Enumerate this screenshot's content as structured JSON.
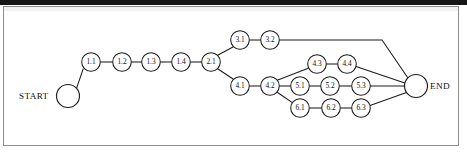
{
  "figure": {
    "kind": "activity-on-node-network-diagram",
    "background_color": "#ffffff",
    "line_color": "#1b1b1b",
    "frame_color": "#8d8d8d",
    "top_band_color": "#151515"
  },
  "terminals": {
    "start": {
      "label": "START",
      "cx": 68,
      "cy": 96,
      "r": 11.5,
      "label_x": 19,
      "label_y": 99
    },
    "end": {
      "label": "END",
      "cx": 416,
      "cy": 86,
      "r": 11.5,
      "label_x": 430,
      "label_y": 89
    }
  },
  "nodes": [
    {
      "id": "1.1",
      "label": "1.1",
      "cx": 91,
      "cy": 62,
      "r": 9.3
    },
    {
      "id": "1.2",
      "label": "1.2",
      "cx": 122,
      "cy": 62,
      "r": 9.3
    },
    {
      "id": "1.3",
      "label": "1.3",
      "cx": 151,
      "cy": 62,
      "r": 9.3
    },
    {
      "id": "1.4",
      "label": "1.4",
      "cx": 181,
      "cy": 62,
      "r": 9.3
    },
    {
      "id": "2.1",
      "label": "2.1",
      "cx": 211,
      "cy": 62,
      "r": 9.3
    },
    {
      "id": "3.1",
      "label": "3.1",
      "cx": 240,
      "cy": 40,
      "r": 9.3
    },
    {
      "id": "3.2",
      "label": "3.2",
      "cx": 270,
      "cy": 40,
      "r": 9.3
    },
    {
      "id": "4.1",
      "label": "4.1",
      "cx": 240,
      "cy": 86,
      "r": 9.3
    },
    {
      "id": "4.2",
      "label": "4.2",
      "cx": 270,
      "cy": 86,
      "r": 9.3
    },
    {
      "id": "4.3",
      "label": "4.3",
      "cx": 317,
      "cy": 64,
      "r": 9.3
    },
    {
      "id": "4.4",
      "label": "4.4",
      "cx": 347,
      "cy": 64,
      "r": 9.3
    },
    {
      "id": "5.1",
      "label": "5.1",
      "cx": 300,
      "cy": 86,
      "r": 9.3
    },
    {
      "id": "5.2",
      "label": "5.2",
      "cx": 330,
      "cy": 86,
      "r": 9.3
    },
    {
      "id": "5.3",
      "label": "5.3",
      "cx": 361,
      "cy": 86,
      "r": 9.3
    },
    {
      "id": "6.1",
      "label": "6.1",
      "cx": 300,
      "cy": 108,
      "r": 9.3
    },
    {
      "id": "6.2",
      "label": "6.2",
      "cx": 331,
      "cy": 108,
      "r": 9.3
    },
    {
      "id": "6.3",
      "label": "6.3",
      "cx": 361,
      "cy": 108,
      "r": 9.3
    }
  ],
  "edges": [
    {
      "from": "START",
      "to": "1.1",
      "points": "76.5,88.4 83.3,68.6"
    },
    {
      "from": "1.1",
      "to": "1.2",
      "points": "100.3,62 112.7,62"
    },
    {
      "from": "1.2",
      "to": "1.3",
      "points": "131.3,62 141.7,62"
    },
    {
      "from": "1.3",
      "to": "1.4",
      "points": "160.3,62 171.7,62"
    },
    {
      "from": "1.4",
      "to": "2.1",
      "points": "190.3,62 201.7,62"
    },
    {
      "from": "2.1",
      "to": "3.1",
      "points": "217.6,55.2 233.4,46.8"
    },
    {
      "from": "2.1",
      "to": "4.1",
      "points": "217.6,68.8 233.4,79.2"
    },
    {
      "from": "3.1",
      "to": "3.2",
      "points": "249.3,40 260.7,40"
    },
    {
      "from": "3.2",
      "to": "END",
      "points": "279.3,40 382,40 409,79.5"
    },
    {
      "from": "4.1",
      "to": "4.2",
      "points": "249.3,86 260.7,86"
    },
    {
      "from": "4.2",
      "to": "4.3",
      "points": "277.2,80.2 308.2,68.3"
    },
    {
      "from": "4.2",
      "to": "5.1",
      "points": "279.3,86 290.7,86"
    },
    {
      "from": "4.2",
      "to": "6.1",
      "points": "277.2,92.2 292.3,102.6"
    },
    {
      "from": "4.3",
      "to": "4.4",
      "points": "326.3,64 337.7,64"
    },
    {
      "from": "4.4",
      "to": "END",
      "points": "356,66.5 405.5,83.2"
    },
    {
      "from": "5.1",
      "to": "5.2",
      "points": "309.3,86 320.7,86"
    },
    {
      "from": "5.2",
      "to": "5.3",
      "points": "339.3,86 351.7,86"
    },
    {
      "from": "5.3",
      "to": "END",
      "points": "370.3,86 404.5,86"
    },
    {
      "from": "6.1",
      "to": "6.2",
      "points": "309.3,108 321.7,108"
    },
    {
      "from": "6.2",
      "to": "6.3",
      "points": "340.3,108 351.7,108"
    },
    {
      "from": "6.3",
      "to": "END",
      "points": "370,105.4 406.5,92.6"
    }
  ]
}
